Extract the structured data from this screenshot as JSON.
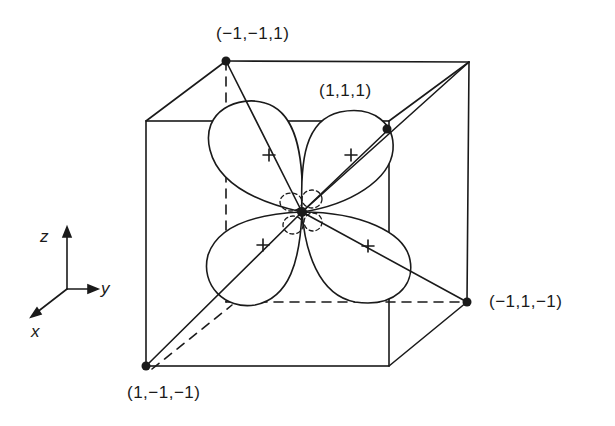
{
  "diagram": {
    "type": "orbital-in-cube",
    "colors": {
      "ink": "#1a1a1a",
      "background": "#ffffff"
    },
    "vertex_labels": {
      "top_back_left": "(−1,−1,1)",
      "top_back_right_diag": "(1,1,1)",
      "bottom_back_right": "(−1,1,−1)",
      "bottom_front_left": "(1,−1,−1)"
    },
    "axes": {
      "z": "z",
      "y": "y",
      "x": "x"
    },
    "lobe_signs": {
      "upper_left": "+",
      "upper_right": "+",
      "lower_left": "+",
      "lower_right": "+",
      "center_small_lobes": "−"
    }
  }
}
